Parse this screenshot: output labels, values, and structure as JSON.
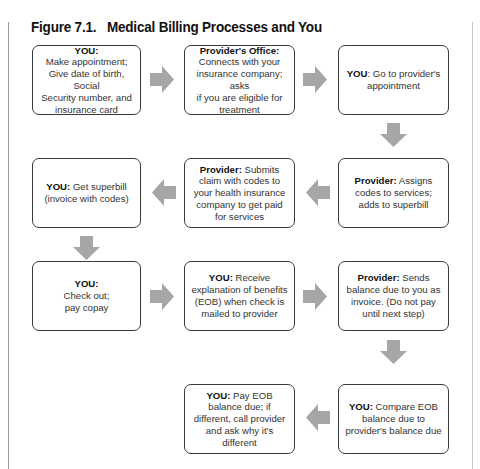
{
  "figure": {
    "title": "Figure 7.1.   Medical Billing Processes and You"
  },
  "steps": [
    {
      "actor": "YOU:",
      "text": "Make appointment; Give date of birth, Social Security number, and insurance card",
      "lines": [
        "Make appointment;",
        "Give date of birth, Social",
        "Security number, and",
        "insurance card"
      ]
    },
    {
      "actor": "Provider's Office:",
      "text": "Connects with your insurance company;  asks if you are eligible for treatment",
      "lines": [
        "Connects with your",
        "insurance company;  asks",
        "if you are eligible for",
        "treatment"
      ]
    },
    {
      "actor": "YOU",
      "text": ": Go to provider's appointment"
    },
    {
      "actor": "Provider:",
      "text": " Assigns codes to services; adds to superbill"
    },
    {
      "actor": "Provider:",
      "text": " Submits claim with codes to your health insurance company to get paid for services"
    },
    {
      "actor": "YOU:",
      "text": " Get superbill (invoice with codes)"
    },
    {
      "actor": "YOU:",
      "text": "Check out; pay copay",
      "lines": [
        "Check out;",
        "pay copay"
      ]
    },
    {
      "actor": "YOU:",
      "text": " Receive explanation of benefits (EOB) when check is mailed to provider"
    },
    {
      "actor": "Provider:",
      "text": " Sends balance due to you as invoice. (Do not pay until next step)"
    },
    {
      "actor": "YOU:",
      "text": " Compare EOB balance due to provider's balance due"
    },
    {
      "actor": "YOU:",
      "text": " Pay EOB balance due; if different, call provider and ask why it's different"
    }
  ],
  "colors": {
    "arrow": "#a6a6a6",
    "box_border": "#3a3a3a",
    "text": "#333333"
  }
}
